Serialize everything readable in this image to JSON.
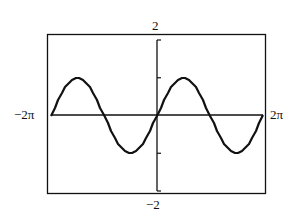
{
  "chart_data": {
    "type": "line",
    "title": "",
    "function": "y = sin(x)",
    "xlabel": "",
    "ylabel": "",
    "xlim": [
      -6.2832,
      6.2832
    ],
    "ylim": [
      -2,
      2
    ],
    "x_tick_labels": {
      "min": "−2π",
      "max": "2π"
    },
    "y_tick_labels": {
      "max": "2",
      "min": "−2"
    },
    "y_ticks": [
      -2,
      -1,
      1,
      2
    ],
    "grid": false,
    "legend": null,
    "series": [
      {
        "name": "sin(x)",
        "x": [
          -6.2832,
          -5.4978,
          -4.7124,
          -3.927,
          -3.1416,
          -2.3562,
          -1.5708,
          -0.7854,
          0,
          0.7854,
          1.5708,
          2.3562,
          3.1416,
          3.927,
          4.7124,
          5.4978,
          6.2832
        ],
        "values": [
          0,
          0.7071,
          1,
          0.7071,
          0,
          -0.7071,
          -1,
          -0.7071,
          0,
          0.7071,
          1,
          0.7071,
          0,
          -0.7071,
          -1,
          -0.7071,
          0
        ]
      }
    ],
    "colors": {
      "line": "#111111",
      "axes": "#111111",
      "frame": "#111111"
    }
  },
  "labels": {
    "x_min": "−2π",
    "x_max": "2π",
    "y_max": "2",
    "y_min": "−2"
  }
}
